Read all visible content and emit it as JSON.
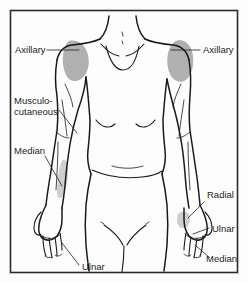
{
  "figure": {
    "background_color": "#fdfdfd",
    "frame_color": "#2b2b2b",
    "line_color": "#1a1a1a",
    "shade_color": "#a8a8a8",
    "shade_color_light": "#c4c4c4",
    "text_color": "#231f20"
  },
  "labels": {
    "axillary_left": "Axillary",
    "axillary_right": "Axillary",
    "musculocutaneous_line1": "Musculo-",
    "musculocutaneous_line2": "cutaneous",
    "median_left": "Median",
    "ulnar_left": "Ulnar",
    "radial_right": "Radial",
    "ulnar_right": "Ulnar",
    "median_right": "Median"
  },
  "shaded_regions": [
    {
      "name": "axillary-left-shading",
      "nerve": "Axillary",
      "side": "left"
    },
    {
      "name": "axillary-right-shading",
      "nerve": "Axillary",
      "side": "right"
    },
    {
      "name": "median-left-shading",
      "nerve": "Median",
      "side": "left"
    },
    {
      "name": "radial-right-shading",
      "nerve": "Radial",
      "side": "right"
    }
  ]
}
